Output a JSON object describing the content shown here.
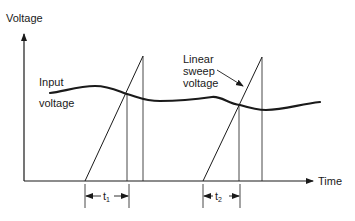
{
  "axes": {
    "y_label": "Voltage",
    "x_label": "Time"
  },
  "labels": {
    "input_line1": "Input",
    "input_line2": "voltage",
    "sweep_line1": "Linear",
    "sweep_line2": "sweep",
    "sweep_line3": "voltage",
    "t1_base": "t",
    "t1_sub": "1",
    "t2_base": "t",
    "t2_sub": "2"
  },
  "colors": {
    "ink": "#1a1a1a",
    "background": "#ffffff"
  }
}
